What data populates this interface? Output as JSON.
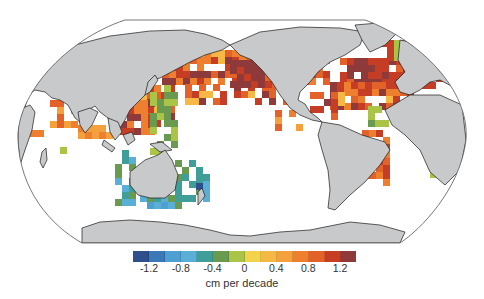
{
  "legend": {
    "label": "cm per decade",
    "ticks": [
      {
        "value": "-1.2",
        "pos": 1
      },
      {
        "value": "-0.8",
        "pos": 3
      },
      {
        "value": "-0.4",
        "pos": 5
      },
      {
        "value": "0",
        "pos": 7
      },
      {
        "value": "0.4",
        "pos": 9
      },
      {
        "value": "0.8",
        "pos": 11
      },
      {
        "value": "1.2",
        "pos": 13
      }
    ],
    "colors": [
      "#2d4f8c",
      "#3a78b8",
      "#4ea0d2",
      "#5aafd6",
      "#3f9e98",
      "#6a9a50",
      "#a9c447",
      "#f2d34b",
      "#f5b845",
      "#f4a03d",
      "#ee7f2e",
      "#e2622a",
      "#c43d24",
      "#8e3a3a"
    ]
  },
  "map": {
    "projection": "Robinson (Pacific-centered)",
    "land_color": "#c8c9cb",
    "regions": [
      {
        "name": "North Pacific",
        "trend": "strong positive"
      },
      {
        "name": "North Atlantic",
        "trend": "strong positive"
      },
      {
        "name": "Western Pacific / Indonesia",
        "trend": "positive"
      },
      {
        "name": "Around Australia",
        "trend": "negative"
      },
      {
        "name": "Central Pacific west of Hawaii",
        "trend": "negative"
      },
      {
        "name": "Tropical Atlantic",
        "trend": "negative"
      },
      {
        "name": "SE South America coast",
        "trend": "positive"
      }
    ]
  }
}
